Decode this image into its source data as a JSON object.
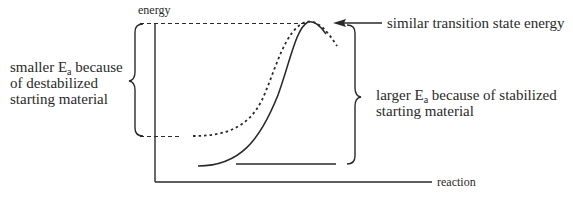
{
  "diagram": {
    "type": "reaction-energy-diagram",
    "axes": {
      "y_label": "energy",
      "x_label": "reaction"
    },
    "annotations": {
      "left": {
        "line1_prefix": "smaller E",
        "line1_sub": "a",
        "line1_suffix": " because",
        "line2": "of destabilized",
        "line3": "starting material"
      },
      "right": {
        "line1_prefix": "larger E",
        "line1_sub": "a",
        "line1_suffix": " because of stabilized",
        "line2": "starting material"
      },
      "top": "similar transition state energy"
    },
    "curves": [
      {
        "name": "destabilized-starting-material",
        "style": "dotted"
      },
      {
        "name": "stabilized-starting-material",
        "style": "solid"
      }
    ],
    "colors": {
      "line": "#2a2a2a",
      "background": "#ffffff"
    }
  }
}
